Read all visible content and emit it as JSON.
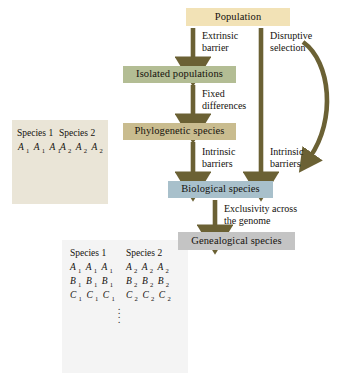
{
  "diagram": {
    "nodes": [
      {
        "id": "population",
        "label": "Population",
        "color": "#f2e2b6"
      },
      {
        "id": "isolated-populations",
        "label": "Isolated populations",
        "color": "#b3bd94"
      },
      {
        "id": "phylogenetic-species",
        "label": "Phylogenetic species",
        "color": "#c9bc8f"
      },
      {
        "id": "biological-species",
        "label": "Biological species",
        "color": "#a8c0cb"
      },
      {
        "id": "genealogical-species",
        "label": "Genealogical species",
        "color": "#c4c4c4"
      }
    ],
    "edge_labels": [
      {
        "id": "extrinsic-barrier",
        "line1": "Extrinsic",
        "line2": "barrier"
      },
      {
        "id": "fixed-differences",
        "line1": "Fixed",
        "line2": "differences"
      },
      {
        "id": "intrinsic-barriers",
        "line1": "Intrinsic",
        "line2": "barriers"
      },
      {
        "id": "disruptive-selection",
        "line1": "Disruptive",
        "line2": "selection"
      },
      {
        "id": "intrinsic-barriers-right",
        "line1": "Intrinsic",
        "line2": "barriers"
      },
      {
        "id": "exclusivity",
        "line1": "Exclusivity across",
        "line2": "the genome"
      }
    ],
    "arrow_color": "#6b6134",
    "curve_color": "#6b6134"
  },
  "panel_one": {
    "id": "single-locus-tree",
    "background": "#eae5d7",
    "species_labels": [
      "Species 1",
      "Species 2"
    ],
    "allele_rows": [
      {
        "left": [
          "A1",
          "A1",
          "A1"
        ],
        "right": [
          "A2",
          "A2",
          "A2"
        ]
      }
    ]
  },
  "panel_two": {
    "id": "multi-locus-tree",
    "background": "#f4f4f4",
    "species_labels": [
      "Species 1",
      "Species 2"
    ],
    "allele_rows": [
      {
        "left": [
          "A1",
          "A1",
          "A1"
        ],
        "right": [
          "A2",
          "A2",
          "A2"
        ]
      },
      {
        "left": [
          "B1",
          "B1",
          "B1"
        ],
        "right": [
          "B2",
          "B2",
          "B2"
        ]
      },
      {
        "left": [
          "C1",
          "C1",
          "C1"
        ],
        "right": [
          "C2",
          "C2",
          "C2"
        ]
      }
    ],
    "ellipsis": "vertical-dots"
  }
}
